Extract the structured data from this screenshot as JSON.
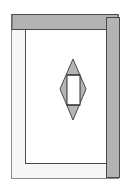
{
  "diagram": {
    "type": "door-frame-elevation",
    "colors": {
      "background": "#ffffff",
      "frame_fill": "#f6f6f6",
      "panel_fill": "#ffffff",
      "bar_fill": "#b3b3b3",
      "diamond_fill": "#b5b5b5",
      "diamond_center_fill": "#ffffff",
      "stroke": "#4a4a4a",
      "stroke_light": "#8a8a8a"
    },
    "outer_frame": {
      "x": 11,
      "y": 14,
      "w": 108,
      "h": 165
    },
    "top_bar": {
      "x": 12,
      "y": 14,
      "w": 107,
      "h": 15
    },
    "right_bar": {
      "x": 106,
      "y": 17,
      "w": 14,
      "h": 160
    },
    "inner_opening": {
      "x": 25,
      "y": 29,
      "w": 81,
      "h": 135
    },
    "diamond": {
      "top": [
        73,
        59
      ],
      "bottom": [
        73,
        120
      ],
      "left": [
        60,
        89
      ],
      "right": [
        86,
        89
      ],
      "inner_rect": {
        "x": 67,
        "y": 75,
        "w": 13,
        "h": 30
      }
    }
  }
}
